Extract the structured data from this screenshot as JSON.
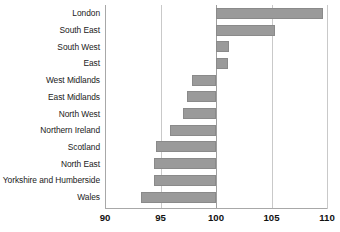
{
  "chart_data": {
    "type": "bar",
    "orientation": "horizontal",
    "title": "",
    "subtitle": "",
    "xlabel": "",
    "ylabel": "",
    "xlim": [
      90,
      110
    ],
    "xticks": [
      90,
      95,
      100,
      105,
      110
    ],
    "xtick_labels": [
      "90",
      "95",
      "100",
      "105",
      "110"
    ],
    "grid": true,
    "grid_axis": "x",
    "legend": false,
    "reference_line": 100,
    "bar_color": "#9a9a9a",
    "bar_border_color": "#8a8a8a",
    "gridline_color": "#c9c9c9",
    "axis_color": "#a8a8a8",
    "categories": [
      "London",
      "South East",
      "South West",
      "East",
      "West Midlands",
      "East Midlands",
      "North West",
      "Northern Ireland",
      "Scotland",
      "North East",
      "Yorkshire and Humberside",
      "Wales"
    ],
    "values": [
      109.6,
      105.3,
      101.2,
      101.1,
      97.8,
      97.4,
      97.0,
      95.9,
      94.6,
      94.4,
      94.4,
      93.2
    ],
    "series": [
      {
        "name": "Index value",
        "values": [
          109.6,
          105.3,
          101.2,
          101.1,
          97.8,
          97.4,
          97.0,
          95.9,
          94.6,
          94.4,
          94.4,
          93.2
        ]
      }
    ]
  }
}
